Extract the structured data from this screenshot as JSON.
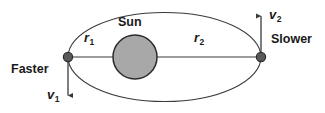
{
  "figure": {
    "background_color": "#ffffff",
    "stroke_color": "#333333",
    "text_color": "#1a1a1a",
    "sun_fill_color": "#a8a8a8",
    "vertex_dot_color": "#5a5a5a"
  },
  "labels": {
    "sun": "Sun",
    "faster": "Faster",
    "slower": "Slower",
    "r1": "r",
    "r1_sub": "1",
    "r2": "r",
    "r2_sub": "2",
    "v1": "v",
    "v1_sub": "1",
    "v2": "v",
    "v2_sub": "2"
  },
  "geometry": {
    "ellipse": {
      "cx": 164.5,
      "cy": 57,
      "rx": 96.5,
      "ry": 44.5
    },
    "sun": {
      "cx": 135,
      "cy": 57,
      "r": 22
    },
    "left_vertex": {
      "x": 68,
      "y": 57
    },
    "right_vertex": {
      "x": 261,
      "y": 57
    },
    "major_axis": {
      "x1": 68,
      "y1": 57,
      "x2": 261,
      "y2": 57
    },
    "v1_arrow": {
      "x1": 68,
      "y1": 57,
      "x2": 68,
      "y2": 101,
      "direction": "down"
    },
    "v2_arrow": {
      "x1": 261,
      "y1": 57,
      "x2": 261,
      "y2": 10,
      "direction": "up"
    }
  }
}
